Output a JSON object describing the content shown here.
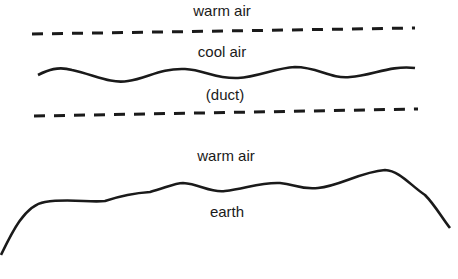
{
  "diagram": {
    "labels": {
      "warm_air_top": "warm air",
      "cool_air": "cool air",
      "duct": "(duct)",
      "warm_air_lower": "warm air",
      "earth": "earth"
    },
    "layers": [
      {
        "name": "warm air",
        "position": "top"
      },
      {
        "name": "boundary",
        "style": "dashed"
      },
      {
        "name": "cool air",
        "position": "upper duct"
      },
      {
        "name": "wavy boundary",
        "style": "solid"
      },
      {
        "name": "(duct)",
        "position": "lower duct"
      },
      {
        "name": "boundary",
        "style": "dashed"
      },
      {
        "name": "warm air",
        "position": "near surface"
      },
      {
        "name": "earth surface",
        "style": "solid curve"
      },
      {
        "name": "earth",
        "position": "bottom"
      }
    ],
    "colors": {
      "line": "#1a1a1a",
      "background": "#ffffff"
    }
  }
}
